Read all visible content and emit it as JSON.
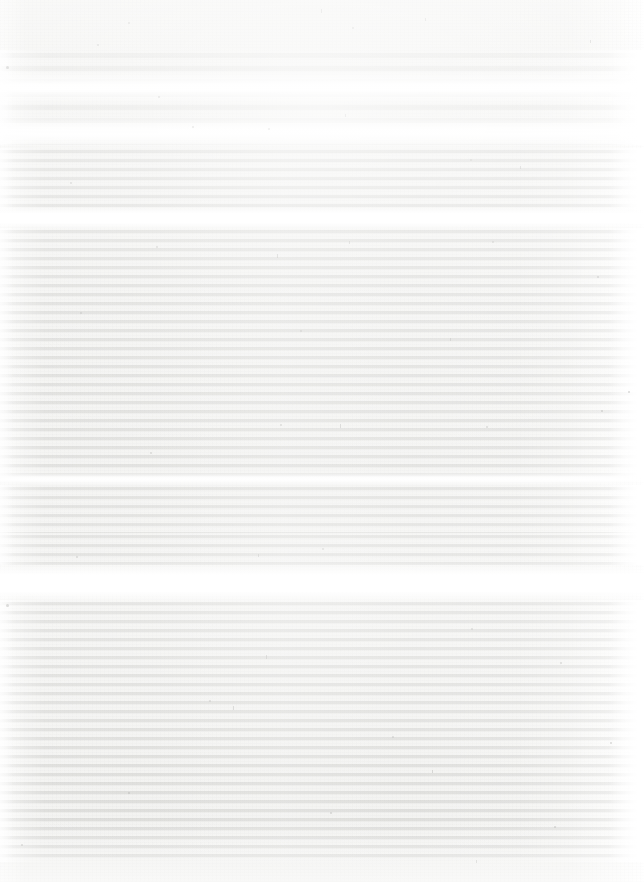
{
  "document": {
    "kind": "scanned-page",
    "legibility": "illegible",
    "note_visible_text": "none",
    "page_width": 644,
    "page_height": 882,
    "ocr_text": ""
  },
  "palette": {
    "paper": "#f2f2f0",
    "paper_light": "#fafaf9",
    "striation": "#bcbcb9",
    "striation_light": "#d6d6d3",
    "glare": "#ffffff",
    "speck": "#adadab"
  },
  "regions": [
    {
      "id": "top-margin",
      "role": "margin",
      "top": 0,
      "height": 50,
      "label": "blank top margin"
    },
    {
      "id": "heading-zone",
      "role": "heading",
      "top": 50,
      "height": 95,
      "label": "heading block, blown out"
    },
    {
      "id": "block-1",
      "role": "body",
      "top": 148,
      "height": 62,
      "label": "text block 1"
    },
    {
      "id": "gap-1",
      "role": "separator",
      "top": 210,
      "height": 18,
      "label": "paragraph gap"
    },
    {
      "id": "block-2",
      "role": "body",
      "top": 228,
      "height": 249,
      "label": "text block 2"
    },
    {
      "id": "gap-2",
      "role": "separator",
      "top": 477,
      "height": 8,
      "label": "paragraph gap"
    },
    {
      "id": "block-3",
      "role": "body",
      "top": 485,
      "height": 48,
      "label": "text block 3"
    },
    {
      "id": "block-4",
      "role": "body",
      "top": 533,
      "height": 32,
      "label": "text block 4"
    },
    {
      "id": "gap-3",
      "role": "separator",
      "top": 565,
      "height": 35,
      "label": "section separator"
    },
    {
      "id": "block-5",
      "role": "body",
      "top": 600,
      "height": 90,
      "label": "text block 5"
    },
    {
      "id": "block-6",
      "role": "body",
      "top": 690,
      "height": 172,
      "label": "text block 6"
    },
    {
      "id": "bottom-margin",
      "role": "margin",
      "top": 862,
      "height": 20,
      "label": "blank bottom margin"
    }
  ],
  "glare_bands": [
    {
      "id": "glare-1",
      "top": 70,
      "height": 34,
      "style": "soft"
    },
    {
      "id": "glare-2",
      "top": 116,
      "height": 32,
      "style": "soft"
    },
    {
      "id": "glare-3",
      "top": 206,
      "height": 24,
      "style": "hard"
    },
    {
      "id": "glare-4",
      "top": 472,
      "height": 14,
      "style": "soft"
    },
    {
      "id": "glare-5",
      "top": 562,
      "height": 42,
      "style": "hard"
    }
  ],
  "text_metrics": {
    "line_pitch_px": 9,
    "content_left_px": 5,
    "content_right_px": 630
  },
  "specks": [
    {
      "x": 128,
      "y": 22,
      "w": 2,
      "h": 2
    },
    {
      "x": 321,
      "y": 9,
      "w": 1,
      "h": 4
    },
    {
      "x": 352,
      "y": 27,
      "w": 2,
      "h": 2
    },
    {
      "x": 425,
      "y": 18,
      "w": 1,
      "h": 3
    },
    {
      "x": 97,
      "y": 44,
      "w": 2,
      "h": 2
    },
    {
      "x": 590,
      "y": 40,
      "w": 1,
      "h": 3
    },
    {
      "x": 6,
      "y": 66,
      "w": 3,
      "h": 3
    },
    {
      "x": 158,
      "y": 96,
      "w": 2,
      "h": 2
    },
    {
      "x": 192,
      "y": 126,
      "w": 2,
      "h": 2
    },
    {
      "x": 268,
      "y": 128,
      "w": 2,
      "h": 2
    },
    {
      "x": 345,
      "y": 114,
      "w": 1,
      "h": 3
    },
    {
      "x": 70,
      "y": 182,
      "w": 2,
      "h": 2
    },
    {
      "x": 470,
      "y": 159,
      "w": 2,
      "h": 2
    },
    {
      "x": 520,
      "y": 166,
      "w": 1,
      "h": 3
    },
    {
      "x": 156,
      "y": 246,
      "w": 2,
      "h": 2
    },
    {
      "x": 277,
      "y": 254,
      "w": 1,
      "h": 4
    },
    {
      "x": 492,
      "y": 241,
      "w": 2,
      "h": 2
    },
    {
      "x": 597,
      "y": 276,
      "w": 2,
      "h": 2
    },
    {
      "x": 349,
      "y": 241,
      "w": 1,
      "h": 3
    },
    {
      "x": 80,
      "y": 312,
      "w": 2,
      "h": 2
    },
    {
      "x": 300,
      "y": 330,
      "w": 2,
      "h": 2
    },
    {
      "x": 450,
      "y": 338,
      "w": 1,
      "h": 3
    },
    {
      "x": 280,
      "y": 424,
      "w": 2,
      "h": 2
    },
    {
      "x": 672,
      "y": 400,
      "w": 2,
      "h": 2
    },
    {
      "x": 150,
      "y": 452,
      "w": 2,
      "h": 2
    },
    {
      "x": 340,
      "y": 424,
      "w": 1,
      "h": 4
    },
    {
      "x": 486,
      "y": 426,
      "w": 2,
      "h": 2
    },
    {
      "x": 601,
      "y": 410,
      "w": 2,
      "h": 2
    },
    {
      "x": 628,
      "y": 391,
      "w": 2,
      "h": 2
    },
    {
      "x": 76,
      "y": 556,
      "w": 2,
      "h": 2
    },
    {
      "x": 258,
      "y": 554,
      "w": 1,
      "h": 3
    },
    {
      "x": 322,
      "y": 548,
      "w": 2,
      "h": 2
    },
    {
      "x": 6,
      "y": 604,
      "w": 3,
      "h": 3
    },
    {
      "x": 471,
      "y": 628,
      "w": 2,
      "h": 2
    },
    {
      "x": 266,
      "y": 655,
      "w": 1,
      "h": 4
    },
    {
      "x": 560,
      "y": 662,
      "w": 2,
      "h": 2
    },
    {
      "x": 209,
      "y": 700,
      "w": 2,
      "h": 2
    },
    {
      "x": 233,
      "y": 706,
      "w": 1,
      "h": 4
    },
    {
      "x": 392,
      "y": 736,
      "w": 2,
      "h": 2
    },
    {
      "x": 843,
      "y": 712,
      "w": 2,
      "h": 2
    },
    {
      "x": 128,
      "y": 792,
      "w": 2,
      "h": 2
    },
    {
      "x": 330,
      "y": 812,
      "w": 2,
      "h": 2
    },
    {
      "x": 432,
      "y": 770,
      "w": 1,
      "h": 3
    },
    {
      "x": 554,
      "y": 826,
      "w": 2,
      "h": 2
    },
    {
      "x": 610,
      "y": 742,
      "w": 2,
      "h": 2
    },
    {
      "x": 21,
      "y": 844,
      "w": 2,
      "h": 2
    },
    {
      "x": 476,
      "y": 860,
      "w": 1,
      "h": 3
    }
  ]
}
